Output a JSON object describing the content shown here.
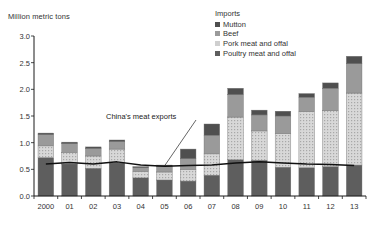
{
  "chart_data": {
    "type": "bar",
    "title": "",
    "ylabel": "Million metric tons",
    "xlabel": "",
    "ylim": [
      0,
      3.0
    ],
    "yticks": [
      "0.0",
      "0.5",
      "1.0",
      "1.5",
      "2.0",
      "2.5",
      "3.0"
    ],
    "ytick_values": [
      0,
      0.5,
      1.0,
      1.5,
      2.0,
      2.5,
      3.0
    ],
    "grid": false,
    "stacked": true,
    "legend_position": "top-right",
    "legend_title": "Imports",
    "categories": [
      "2000",
      "01",
      "02",
      "03",
      "04",
      "05",
      "06",
      "07",
      "08",
      "09",
      "10",
      "11",
      "12",
      "13"
    ],
    "series": [
      {
        "name": "Poultry meat and offal",
        "color": "#5e5e5e",
        "values": [
          0.72,
          0.6,
          0.52,
          0.62,
          0.34,
          0.3,
          0.28,
          0.39,
          0.68,
          0.67,
          0.54,
          0.53,
          0.55,
          0.58
        ]
      },
      {
        "name": "Pork meat and offal",
        "color": "#cfcfcf",
        "values": [
          0.22,
          0.22,
          0.23,
          0.26,
          0.12,
          0.15,
          0.22,
          0.4,
          0.8,
          0.55,
          0.63,
          1.05,
          1.05,
          1.35
        ]
      },
      {
        "name": "Beef",
        "color": "#9a9a9a",
        "values": [
          0.21,
          0.16,
          0.14,
          0.14,
          0.07,
          0.1,
          0.2,
          0.35,
          0.42,
          0.3,
          0.33,
          0.27,
          0.42,
          0.55
        ]
      },
      {
        "name": "Mutton",
        "color": "#4f4f4f",
        "values": [
          0.03,
          0.03,
          0.03,
          0.03,
          0.02,
          0.03,
          0.18,
          0.21,
          0.12,
          0.09,
          0.09,
          0.07,
          0.1,
          0.14
        ]
      }
    ],
    "totals": [
      1.18,
      1.01,
      0.92,
      1.05,
      0.55,
      0.58,
      0.88,
      1.35,
      2.02,
      1.61,
      1.59,
      1.92,
      2.12,
      2.62
    ],
    "overlay_line": {
      "name": "China's meat exports",
      "color": "#111111",
      "values": [
        0.6,
        0.63,
        0.6,
        0.64,
        0.58,
        0.56,
        0.57,
        0.58,
        0.62,
        0.64,
        0.62,
        0.6,
        0.59,
        0.57
      ]
    },
    "annotations": [
      {
        "text": "China's meat exports",
        "target_category": "05"
      }
    ]
  },
  "legend": {
    "title": "Imports",
    "items": [
      {
        "label": "Mutton",
        "color": "#4f4f4f"
      },
      {
        "label": "Beef",
        "color": "#9a9a9a"
      },
      {
        "label": "Pork meat and offal",
        "color": "#cfcfcf"
      },
      {
        "label": "Poultry meat and offal",
        "color": "#5e5e5e"
      }
    ]
  }
}
